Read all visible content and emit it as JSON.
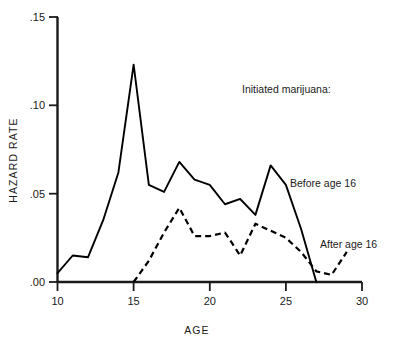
{
  "chart_data": {
    "type": "line",
    "title": "",
    "subtitle": "",
    "xlabel": "AGE",
    "ylabel": "HAZARD RATE",
    "xlim": [
      10,
      30
    ],
    "ylim": [
      0.0,
      0.15
    ],
    "xticks": [
      10,
      15,
      20,
      25,
      30
    ],
    "xticklabels": [
      "10",
      "15",
      "20",
      "25",
      "30"
    ],
    "yticks": [
      0.0,
      0.05,
      0.1,
      0.15
    ],
    "yticklabels": [
      ".00",
      ".05",
      ".10",
      ".15"
    ],
    "grid": false,
    "legend_position": "inline-annotations",
    "legend_heading": "Initiated marijuana:",
    "x": [
      10,
      11,
      12,
      13,
      14,
      15,
      16,
      17,
      18,
      19,
      20,
      21,
      22,
      23,
      24,
      25,
      26,
      27,
      28,
      29
    ],
    "series": [
      {
        "name": "Before age 16",
        "style": "solid",
        "color": "#000000",
        "x": [
          10,
          11,
          12,
          13,
          14,
          15,
          16,
          17,
          18,
          19,
          20,
          21,
          22,
          23,
          24,
          25,
          26,
          27
        ],
        "values": [
          0.005,
          0.015,
          0.014,
          0.035,
          0.062,
          0.123,
          0.055,
          0.051,
          0.068,
          0.058,
          0.055,
          0.044,
          0.047,
          0.038,
          0.066,
          0.055,
          0.03,
          0.0
        ]
      },
      {
        "name": "After age 16",
        "style": "dashed",
        "color": "#000000",
        "x": [
          15,
          16,
          17,
          18,
          19,
          20,
          21,
          22,
          23,
          24,
          25,
          26,
          27,
          28,
          29
        ],
        "values": [
          0.0,
          0.012,
          0.028,
          0.042,
          0.026,
          0.026,
          0.028,
          0.015,
          0.033,
          0.029,
          0.025,
          0.017,
          0.006,
          0.004,
          0.017
        ]
      }
    ],
    "annotations": [
      {
        "name": "legend-heading",
        "text": "Initiated marijuana:",
        "x": 22.0,
        "y": 0.107
      },
      {
        "name": "label-before-age-16",
        "text": "Before age 16",
        "x": 26.2,
        "y": 0.057
      },
      {
        "name": "label-after-age-16",
        "text": "After age 16",
        "x": 28.0,
        "y": 0.022
      }
    ]
  },
  "axes": {
    "y_title": "HAZARD RATE",
    "x_title": "AGE",
    "y_tick_labels": [
      ".15",
      ".10",
      ".05",
      ".00"
    ],
    "x_tick_labels": [
      "10",
      "15",
      "20",
      "25",
      "30"
    ]
  },
  "annotations": {
    "heading": "Initiated marijuana:",
    "before": "Before age 16",
    "after": "After age 16"
  },
  "colors": {
    "background": "#ffffff",
    "ink": "#1a1a1a",
    "line": "#000000"
  }
}
